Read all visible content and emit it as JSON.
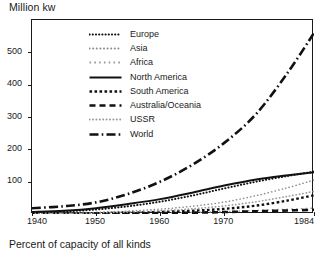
{
  "chart_data": {
    "type": "line",
    "title": "Million kw",
    "caption": "Percent of capacity of all kinds",
    "xlabel": "",
    "ylabel": "Million kw",
    "grid": false,
    "legend_position": "top-center",
    "xlim": [
      1940,
      1984
    ],
    "ylim": [
      0,
      600
    ],
    "ytick_labels": [
      "100",
      "200",
      "300",
      "400",
      "500"
    ],
    "ytick_values": [
      100,
      200,
      300,
      400,
      500
    ],
    "xtick_labels": [
      "1940",
      "1950",
      "1960",
      "1970",
      "1984"
    ],
    "xtick_values": [
      1940,
      1950,
      1960,
      1970,
      1984
    ],
    "x": [
      1940,
      1945,
      1950,
      1955,
      1960,
      1965,
      1970,
      1975,
      1980,
      1984
    ],
    "series": [
      {
        "name": "Europe",
        "style": "dotted",
        "values": [
          5,
          8,
          14,
          24,
          38,
          57,
          79,
          100,
          118,
          131
        ]
      },
      {
        "name": "Asia",
        "style": "fine-dotted",
        "values": [
          2,
          3,
          5,
          9,
          15,
          24,
          37,
          57,
          82,
          105
        ]
      },
      {
        "name": "Africa",
        "style": "sparse-dotted",
        "values": [
          0.5,
          0.8,
          1.2,
          2,
          3.2,
          5,
          7.5,
          11,
          15,
          18
        ]
      },
      {
        "name": "North America",
        "style": "solid",
        "values": [
          6,
          10,
          18,
          31,
          46,
          66,
          88,
          107,
          120,
          129
        ]
      },
      {
        "name": "South America",
        "style": "dashed-square",
        "values": [
          1,
          1.5,
          2.5,
          4,
          6.5,
          10,
          16,
          26,
          42,
          58
        ]
      },
      {
        "name": "Australia/Oceania",
        "style": "dash",
        "values": [
          0.4,
          0.6,
          1,
          1.7,
          2.7,
          4,
          6,
          8.5,
          11,
          13
        ]
      },
      {
        "name": "USSR",
        "style": "fine-dotted-2",
        "values": [
          1.5,
          2,
          3.5,
          6,
          10,
          16,
          25,
          38,
          55,
          70
        ]
      },
      {
        "name": "World",
        "style": "dash-dot",
        "values": [
          18,
          24,
          36,
          62,
          100,
          152,
          220,
          310,
          440,
          560
        ]
      }
    ]
  },
  "legend": {
    "items": [
      {
        "label": "Europe"
      },
      {
        "label": "Asia"
      },
      {
        "label": "Africa"
      },
      {
        "label": "North America"
      },
      {
        "label": "South America"
      },
      {
        "label": "Australia/Oceania"
      },
      {
        "label": "USSR"
      },
      {
        "label": "World"
      }
    ]
  }
}
